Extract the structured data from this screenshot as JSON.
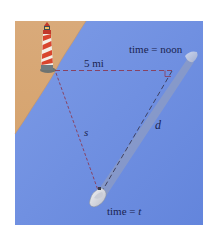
{
  "figure": {
    "colors": {
      "water": "#7193e2",
      "sand": "#d8a878",
      "line": "#8a3a55",
      "text": "#1a2450",
      "wake": "#9aa3b8"
    }
  },
  "labels": {
    "time_noon": "time = noon",
    "distance_shore": "5 mi",
    "side_s": "s",
    "side_d": "d",
    "time_t": "time = t"
  },
  "icons": {
    "lighthouse": "lighthouse-icon",
    "boat_noon": "boat-icon",
    "boat_t": "boat-icon",
    "right_angle": "right-angle-marker"
  }
}
